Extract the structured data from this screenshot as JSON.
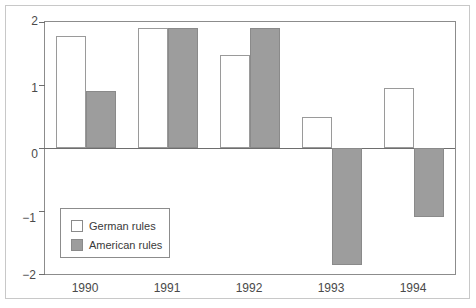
{
  "chart_data": {
    "type": "bar",
    "title": "",
    "subtitle": "",
    "xlabel": "",
    "ylabel": "",
    "categories": [
      "1990",
      "1991",
      "1992",
      "1993",
      "1994"
    ],
    "series": [
      {
        "name": "German rules",
        "color": "#ffffff",
        "values": [
          1.78,
          1.9,
          1.48,
          0.5,
          0.95
        ]
      },
      {
        "name": "American rules",
        "color": "#9d9d9d",
        "values": [
          0.9,
          1.9,
          1.9,
          -1.85,
          -1.1
        ]
      }
    ],
    "ylim": [
      -2,
      2
    ],
    "yticks": [
      2,
      1,
      0,
      -1,
      -2
    ],
    "ytick_labels": [
      "2",
      "1",
      "0",
      "−1",
      "−2"
    ],
    "grid": false,
    "legend_position": "lower-left",
    "zero_line": true
  },
  "legend": {
    "items": [
      {
        "label": "German rules",
        "swatch": "german"
      },
      {
        "label": "American rules",
        "swatch": "american"
      }
    ]
  }
}
